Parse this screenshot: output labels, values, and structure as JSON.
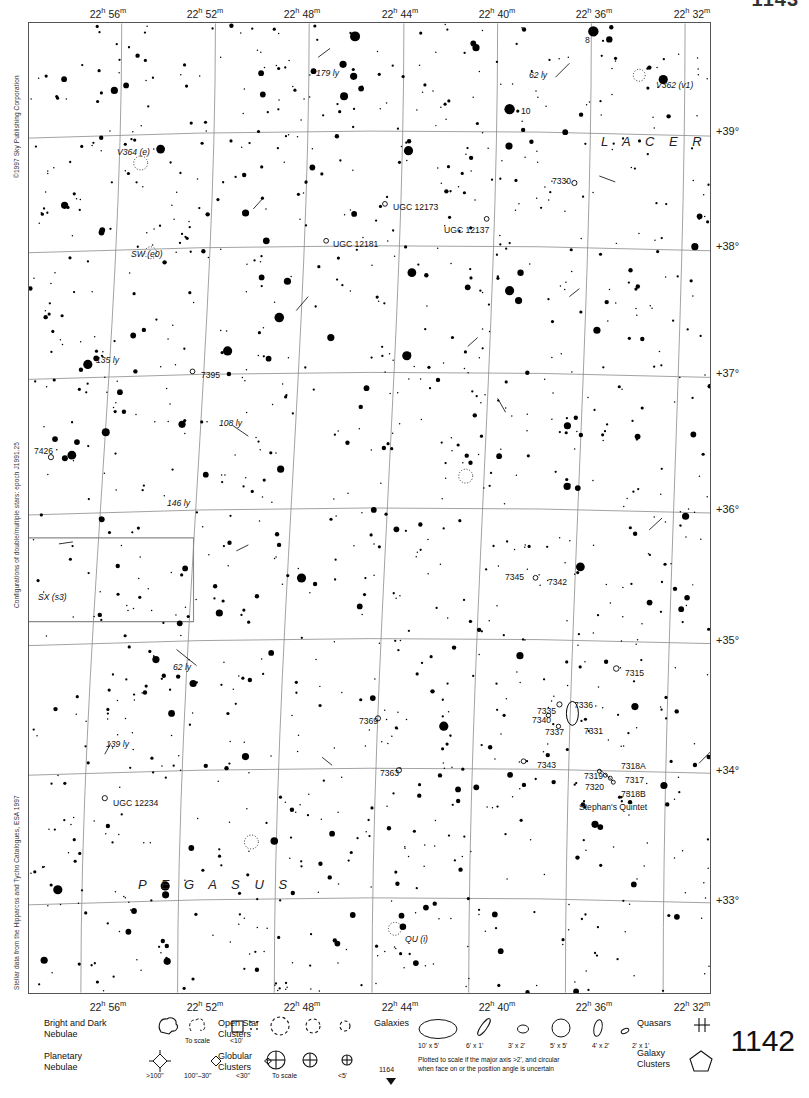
{
  "chart_data": {
    "type": "scatter",
    "xlabel": "Right Ascension",
    "ylabel": "Declination",
    "grid": true,
    "xlim": [
      "22h 58m",
      "22h 30m"
    ],
    "ylim": [
      32.5,
      39.6
    ],
    "ra_ticks": [
      "22h 56m",
      "22h 52m",
      "22h 48m",
      "22h 44m",
      "22h 40m",
      "22h 36m",
      "22h 32m"
    ],
    "dec_ticks": [
      "+39°",
      "+38°",
      "+37°",
      "+36°",
      "+35°",
      "+34°",
      "+33°"
    ],
    "constellations": [
      "LACERTA",
      "PEGASUS"
    ],
    "annotations": [
      "179 ly",
      "62 ly",
      "135 ly",
      "108 ly",
      "146 ly",
      "139 ly",
      "62 ly",
      "V362 (v1)",
      "V364 (e)",
      "SW (e0)",
      "SX (s3)",
      "QU (i)",
      "8",
      "10",
      "7330",
      "7395",
      "7426",
      "7345",
      "7342",
      "7315",
      "7336",
      "7335",
      "7340",
      "7337",
      "7331",
      "7369",
      "7343",
      "7363",
      "7319",
      "7320",
      "7317",
      "7318A",
      "7318B",
      "Stephan's Quintet",
      "UGC 12173",
      "UGC 12181",
      "UGC 12137",
      "UGC 12234"
    ]
  },
  "page": {
    "number_top": "1143",
    "number_big": "1142",
    "sheet_ref": "1164"
  },
  "credits": {
    "copyright": "©1997 Sky Publishing Corporation",
    "configurations": "Configurations of double/multiple stars: epoch J1991.25",
    "stellar": "Stellar data from the Hipparcos and Tycho Catalogues, ESA 1997"
  },
  "ra_axis": {
    "labels": [
      {
        "h": "22",
        "m": "56",
        "x": 108
      },
      {
        "h": "22",
        "m": "52",
        "x": 205
      },
      {
        "h": "22",
        "m": "48",
        "x": 302
      },
      {
        "h": "22",
        "m": "44",
        "x": 400
      },
      {
        "h": "22",
        "m": "40",
        "x": 497
      },
      {
        "h": "22",
        "m": "36",
        "x": 594
      },
      {
        "h": "22",
        "m": "32",
        "x": 692
      }
    ]
  },
  "dec_axis": {
    "labels": [
      {
        "text": "+39°",
        "y": 131
      },
      {
        "text": "+38°",
        "y": 246
      },
      {
        "text": "+37°",
        "y": 373
      },
      {
        "text": "+36°",
        "y": 509
      },
      {
        "text": "+35°",
        "y": 640
      },
      {
        "text": "+34°",
        "y": 770
      },
      {
        "text": "+33°",
        "y": 900
      }
    ]
  },
  "constellation_labels": [
    {
      "text": "L A C E R T A",
      "x": 600,
      "y": 133
    },
    {
      "text": "P E G A S U S",
      "x": 137,
      "y": 876
    }
  ],
  "map_labels": [
    {
      "id": "lbl-179ly",
      "text": "179 ly",
      "x": 315,
      "y": 68,
      "style": "ital"
    },
    {
      "id": "lbl-8",
      "text": "8",
      "x": 584,
      "y": 35,
      "style": ""
    },
    {
      "id": "lbl-62ly-a",
      "text": "62 ly",
      "x": 528,
      "y": 70,
      "style": "ital"
    },
    {
      "id": "lbl-v362",
      "text": "V362 (v1)",
      "x": 655,
      "y": 80,
      "style": "ital"
    },
    {
      "id": "lbl-10",
      "text": "10",
      "x": 520,
      "y": 106,
      "style": ""
    },
    {
      "id": "lbl-v364",
      "text": "V364 (e)",
      "x": 116,
      "y": 147,
      "style": "ital"
    },
    {
      "id": "lbl-7330",
      "text": "7330",
      "x": 551,
      "y": 176,
      "style": ""
    },
    {
      "id": "lbl-ugc12173",
      "text": "UGC 12173",
      "x": 392,
      "y": 202,
      "style": ""
    },
    {
      "id": "lbl-ugc12137",
      "text": "UGC 12137",
      "x": 443,
      "y": 225,
      "style": ""
    },
    {
      "id": "lbl-ugc12181",
      "text": "UGC 12181",
      "x": 332,
      "y": 239,
      "style": ""
    },
    {
      "id": "lbl-sw",
      "text": "SW (e0)",
      "x": 130,
      "y": 249,
      "style": "ital"
    },
    {
      "id": "lbl-135ly",
      "text": "135 ly",
      "x": 95,
      "y": 355,
      "style": "ital"
    },
    {
      "id": "lbl-7395",
      "text": "7395",
      "x": 200,
      "y": 370,
      "style": ""
    },
    {
      "id": "lbl-108ly",
      "text": "108 ly",
      "x": 218,
      "y": 418,
      "style": "ital"
    },
    {
      "id": "lbl-7426",
      "text": "7426",
      "x": 33,
      "y": 446,
      "style": ""
    },
    {
      "id": "lbl-146ly",
      "text": "146 ly",
      "x": 166,
      "y": 498,
      "style": "ital"
    },
    {
      "id": "lbl-sx",
      "text": "SX (s3)",
      "x": 37,
      "y": 592,
      "style": "ital"
    },
    {
      "id": "lbl-7345",
      "text": "7345",
      "x": 504,
      "y": 572,
      "style": ""
    },
    {
      "id": "lbl-7342",
      "text": "7342",
      "x": 547,
      "y": 577,
      "style": ""
    },
    {
      "id": "lbl-62ly-b",
      "text": "62 ly",
      "x": 172,
      "y": 662,
      "style": "ital"
    },
    {
      "id": "lbl-7315",
      "text": "7315",
      "x": 624,
      "y": 668,
      "style": ""
    },
    {
      "id": "lbl-7336",
      "text": "7336",
      "x": 573,
      "y": 700,
      "style": ""
    },
    {
      "id": "lbl-7335",
      "text": "7335",
      "x": 536,
      "y": 706,
      "style": ""
    },
    {
      "id": "lbl-7340",
      "text": "7340",
      "x": 531,
      "y": 715,
      "style": ""
    },
    {
      "id": "lbl-7337",
      "text": "7337",
      "x": 544,
      "y": 727,
      "style": ""
    },
    {
      "id": "lbl-7331",
      "text": "7331",
      "x": 583,
      "y": 726,
      "style": ""
    },
    {
      "id": "lbl-7369",
      "text": "7369",
      "x": 358,
      "y": 716,
      "style": ""
    },
    {
      "id": "lbl-139ly",
      "text": "139 ly",
      "x": 105,
      "y": 739,
      "style": "ital"
    },
    {
      "id": "lbl-7343",
      "text": "7343",
      "x": 536,
      "y": 760,
      "style": ""
    },
    {
      "id": "lbl-7363",
      "text": "7363",
      "x": 379,
      "y": 768,
      "style": ""
    },
    {
      "id": "lbl-7318a",
      "text": "7318A",
      "x": 620,
      "y": 761,
      "style": ""
    },
    {
      "id": "lbl-7319",
      "text": "7319",
      "x": 583,
      "y": 771,
      "style": ""
    },
    {
      "id": "lbl-7317",
      "text": "7317",
      "x": 624,
      "y": 775,
      "style": ""
    },
    {
      "id": "lbl-7320",
      "text": "7320",
      "x": 584,
      "y": 782,
      "style": ""
    },
    {
      "id": "lbl-7318b",
      "text": "7318B",
      "x": 620,
      "y": 789,
      "style": ""
    },
    {
      "id": "lbl-quintet",
      "text": "Stephan's Quintet",
      "x": 578,
      "y": 802,
      "style": ""
    },
    {
      "id": "lbl-ugc12234",
      "text": "UGC 12234",
      "x": 112,
      "y": 798,
      "style": ""
    },
    {
      "id": "lbl-qu",
      "text": "QU (i)",
      "x": 404,
      "y": 934,
      "style": "ital"
    }
  ],
  "legend": {
    "nebulae": {
      "bright_dark_line1": "Bright and Dark",
      "bright_dark_line2": "Nebulae",
      "bright_dark_sub1": "To scale",
      "bright_dark_sub2": "<10'",
      "planetary_line1": "Planetary",
      "planetary_line2": "Nebulae",
      "planetary_sub1": ">100\"",
      "planetary_sub2": "100\"–30\"",
      "planetary_sub3": "<30\""
    },
    "clusters": {
      "open_line1": "Open Star",
      "open_line2": "Clusters",
      "globular_line1": "Globular",
      "globular_line2": "Clusters",
      "globular_sub1": "To scale",
      "globular_sub2": "<5'"
    },
    "galaxies": {
      "title": "Galaxies",
      "sizes": [
        "10' x 5'",
        "6' x 1'",
        "3' x 2'",
        "5' x 5'",
        "4' x 2'",
        "2' x 1'"
      ],
      "note_line1": "Plotted to scale if the major axis >2', and circular",
      "note_line2": "when face on or the position angle is uncertain"
    },
    "right": {
      "quasars": "Quasars",
      "galaxy_clusters_line1": "Galaxy",
      "galaxy_clusters_line2": "Clusters"
    }
  },
  "colors": {
    "star": "#000000",
    "grid": "#8a8a8a",
    "border": "#555555",
    "text": "#111111"
  }
}
